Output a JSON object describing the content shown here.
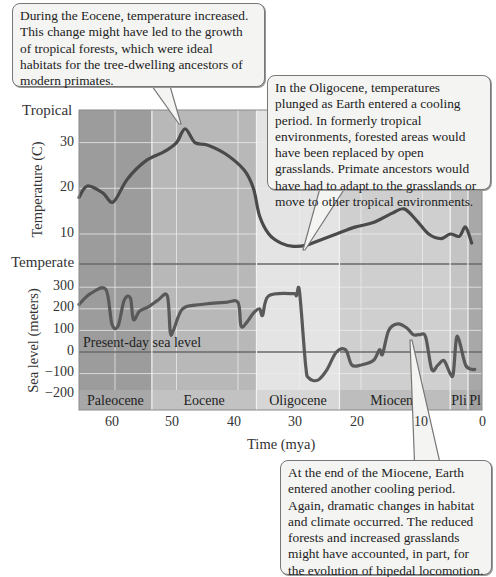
{
  "callouts": {
    "eocene": "During the Eocene, temperature increased. This change might have led to the growth of tropical forests, which were ideal habitats for the tree-dwelling ancestors of modern primates.",
    "oligocene": "In the Oligocene, temperatures plunged as Earth entered a cooling period. In formerly tropical environments, forested areas would have been replaced by open grasslands. Primate ancestors would have had to adapt to the grasslands or move to other tropical environments.",
    "miocene": "At the end of the Miocene, Earth entered another cooling period. Again, dramatic changes in habitat and climate occurred. The reduced forests and increased grasslands might have accounted, in part, for the evolution of bipedal locomotion."
  },
  "labels": {
    "tropical": "Tropical",
    "temperate": "Temperate",
    "temp_axis": "Temperature (C)",
    "sea_axis": "Sea level (meters)",
    "present_day": "Present-day sea level",
    "x_axis": "Time (mya)"
  },
  "temp_ticks": [
    "30",
    "20",
    "10"
  ],
  "sea_ticks": [
    "300",
    "200",
    "100",
    "0",
    "−100",
    "−200"
  ],
  "time_ticks": [
    "60",
    "50",
    "40",
    "30",
    "20",
    "10",
    "0"
  ],
  "epochs": [
    {
      "name": "Paleocene",
      "start": 66,
      "end": 54,
      "color": "#9c9c9c",
      "band": "#a8a8a8"
    },
    {
      "name": "Eocene",
      "start": 54,
      "end": 37,
      "color": "#b8b8b8",
      "band": "#c2c2c2"
    },
    {
      "name": "Oligocene",
      "start": 37,
      "end": 23.5,
      "color": "#e4e4e4",
      "band": "#d6d6d6"
    },
    {
      "name": "Miocene",
      "start": 23.5,
      "end": 5.5,
      "color": "#cfcfcf",
      "band": "#bdbdbd"
    },
    {
      "name": "Pli",
      "start": 5.5,
      "end": 2.6,
      "color": "#c4c4c4",
      "band": "#b4b4b4"
    },
    {
      "name": "Pl",
      "start": 2.6,
      "end": 0,
      "color": "#a8a8a8",
      "band": "#a0a0a0"
    }
  ],
  "colors": {
    "curve": "#4a4a4a",
    "gridline": "#eeeeee",
    "refline": "#6a6a6a",
    "callout_bg": "#f4f4f2",
    "callout_border": "#777777"
  },
  "chart_data": [
    {
      "type": "line",
      "title": "Temperature over the Cenozoic",
      "xlabel": "Time (mya)",
      "ylabel": "Temperature (C)",
      "xlim": [
        66,
        0
      ],
      "ylim": [
        3,
        36
      ],
      "y_annotations": {
        "top": "Tropical",
        "bottom": "Temperate"
      },
      "grid": true,
      "series": [
        {
          "name": "Temperature",
          "x": [
            66,
            64.5,
            62,
            60.3,
            58,
            55,
            52,
            50,
            48.6,
            47,
            45,
            42,
            39,
            37.5,
            36.5,
            35,
            33,
            31,
            29,
            27,
            24,
            21,
            18,
            15,
            13,
            11,
            9,
            7,
            5.5,
            4,
            3,
            2
          ],
          "y": [
            18,
            20.5,
            19,
            17,
            22,
            26,
            28,
            30,
            33,
            30,
            29.5,
            27.5,
            24,
            20,
            14,
            10,
            8,
            7.3,
            7.5,
            8.5,
            10,
            11.5,
            12.5,
            14.5,
            15.5,
            13,
            10,
            9,
            10,
            9.5,
            11.5,
            8
          ]
        }
      ]
    },
    {
      "type": "line",
      "title": "Sea level over the Cenozoic",
      "xlabel": "Time (mya)",
      "ylabel": "Sea level (meters)",
      "xlim": [
        66,
        0
      ],
      "ylim": [
        -250,
        320
      ],
      "annotations": [
        "Present-day sea level (0 m)"
      ],
      "grid": true,
      "series": [
        {
          "name": "Sea level",
          "x": [
            66,
            64,
            61.5,
            60.5,
            59.5,
            58.5,
            57.5,
            57,
            56,
            54.5,
            53,
            51.5,
            51,
            50.5,
            49,
            46,
            42,
            40,
            39.5,
            38.5,
            37.5,
            36.5,
            36,
            35,
            31,
            30.5,
            30,
            29,
            28.5,
            27,
            25.5,
            24,
            22.5,
            21.5,
            20,
            18,
            17,
            16.5,
            15.5,
            14,
            12.5,
            11.5,
            10.5,
            9.5,
            8.5,
            7.5,
            6.5,
            5.5,
            5,
            4.5,
            4,
            3,
            2,
            1.5
          ],
          "y": [
            220,
            270,
            290,
            130,
            120,
            240,
            250,
            150,
            190,
            210,
            240,
            260,
            90,
            100,
            200,
            220,
            230,
            230,
            120,
            140,
            180,
            200,
            170,
            260,
            270,
            260,
            280,
            -60,
            -120,
            -130,
            -80,
            0,
            10,
            -60,
            -60,
            -40,
            10,
            -10,
            100,
            130,
            110,
            80,
            80,
            70,
            -80,
            -60,
            -40,
            -100,
            -100,
            60,
            50,
            -60,
            -80,
            -80
          ]
        }
      ]
    }
  ]
}
